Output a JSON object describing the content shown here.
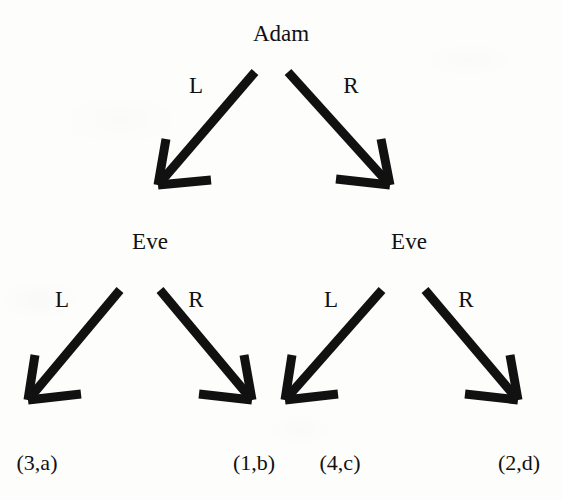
{
  "diagram": {
    "type": "extensive-form-game-tree",
    "background_color": "#fdfdfb",
    "ink_color": "#111111",
    "nodes": [
      {
        "id": "root",
        "label": "Adam",
        "x": 281,
        "y": 22
      },
      {
        "id": "eve-left",
        "label": "Eve",
        "x": 150,
        "y": 230
      },
      {
        "id": "eve-right",
        "label": "Eve",
        "x": 409,
        "y": 230
      }
    ],
    "edges": [
      {
        "id": "root-L",
        "label": "L",
        "from": "root",
        "to": "eve-left",
        "label_x": 196,
        "label_y": 74,
        "x1": 255,
        "y1": 72,
        "x2": 158,
        "y2": 185
      },
      {
        "id": "root-R",
        "label": "R",
        "from": "root",
        "to": "eve-right",
        "label_x": 351,
        "label_y": 74,
        "x1": 288,
        "y1": 72,
        "x2": 390,
        "y2": 185
      },
      {
        "id": "eve-left-L",
        "label": "L",
        "from": "eve-left",
        "to": "payoff-1",
        "label_x": 62,
        "label_y": 288,
        "x1": 120,
        "y1": 290,
        "x2": 28,
        "y2": 400
      },
      {
        "id": "eve-left-R",
        "label": "R",
        "from": "eve-left",
        "to": "payoff-2",
        "label_x": 196,
        "label_y": 288,
        "x1": 160,
        "y1": 290,
        "x2": 252,
        "y2": 400
      },
      {
        "id": "eve-right-L",
        "label": "L",
        "from": "eve-right",
        "to": "payoff-3",
        "label_x": 331,
        "label_y": 288,
        "x1": 382,
        "y1": 290,
        "x2": 285,
        "y2": 400
      },
      {
        "id": "eve-right-R",
        "label": "R",
        "from": "eve-right",
        "to": "payoff-4",
        "label_x": 466,
        "label_y": 288,
        "x1": 425,
        "y1": 290,
        "x2": 518,
        "y2": 400
      }
    ],
    "payoffs": [
      {
        "id": "payoff-1",
        "label": "(3,a)",
        "adam": 3,
        "eve": "a",
        "x": 37,
        "y": 452
      },
      {
        "id": "payoff-2",
        "label": "(1,b)",
        "adam": 1,
        "eve": "b",
        "x": 254,
        "y": 452
      },
      {
        "id": "payoff-3",
        "label": "(4,c)",
        "adam": 4,
        "eve": "c",
        "x": 340,
        "y": 452
      },
      {
        "id": "payoff-4",
        "label": "(2,d)",
        "adam": 2,
        "eve": "d",
        "x": 519,
        "y": 452
      }
    ]
  }
}
